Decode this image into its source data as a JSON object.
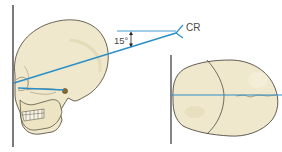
{
  "diagram": {
    "labels": {
      "central_ray": "CR",
      "angle": "15°"
    },
    "views": [
      {
        "name": "lateral",
        "description": "Lateral skull with 15° cephalic central ray angle"
      },
      {
        "name": "superior",
        "description": "Superior view of skull with midsagittal line"
      }
    ],
    "colors": {
      "ray": "#2a8fc8",
      "bone": "#efe8cc",
      "bone_shadow": "#d9cfa6",
      "outline": "#3a3530",
      "image_receptor": "#222222"
    }
  }
}
